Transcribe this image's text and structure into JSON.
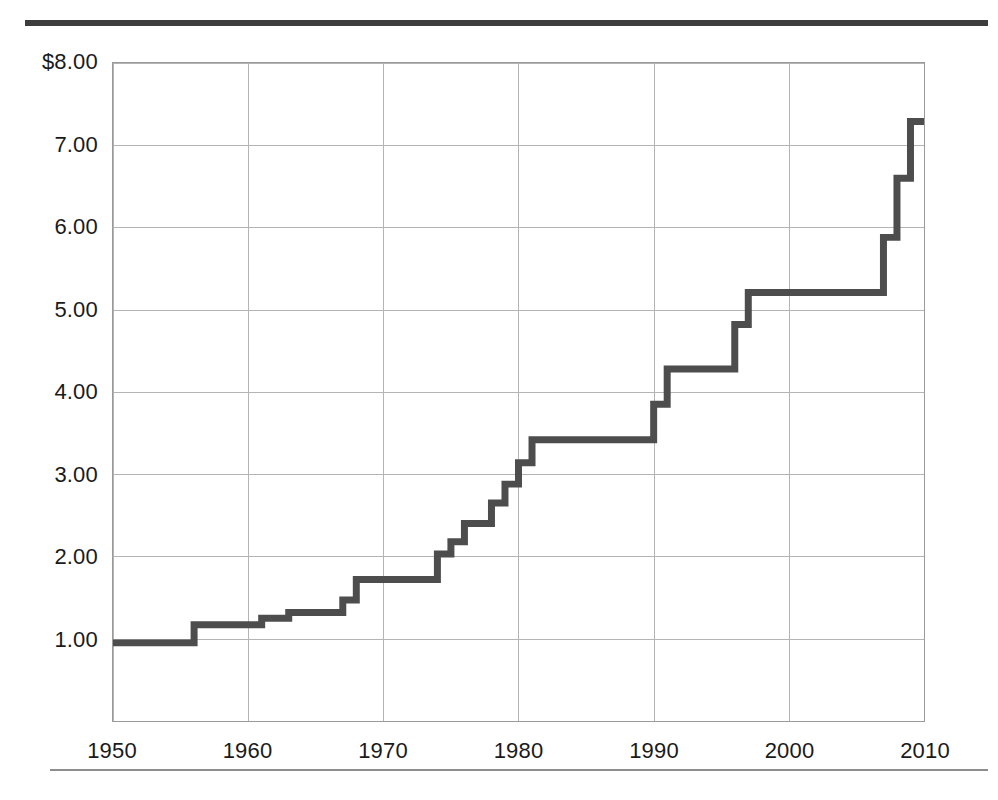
{
  "figure": {
    "top_rule_color": "#3d3d3d",
    "bottom_rule_color": "#8e8e8e"
  },
  "chart_data": {
    "type": "line",
    "line_style": "step-post",
    "title": "",
    "subtitle": "",
    "xlabel": "",
    "ylabel": "",
    "xlim": [
      1950,
      2010
    ],
    "ylim": [
      0,
      8
    ],
    "grid": true,
    "legend": null,
    "line_color": "#4d4d4d",
    "grid_color": "#b4b4b4",
    "axis_color": "#9a9a9a",
    "y_ticks": [
      1,
      2,
      3,
      4,
      5,
      6,
      7,
      8
    ],
    "y_tick_labels": [
      "1.00",
      "2.00",
      "3.00",
      "4.00",
      "5.00",
      "6.00",
      "7.00",
      "$8.00"
    ],
    "x_ticks": [
      1950,
      1960,
      1970,
      1980,
      1990,
      2000,
      2010
    ],
    "x_tick_labels": [
      "1950",
      "1960",
      "1970",
      "1980",
      "1990",
      "2000",
      "2010"
    ],
    "x": [
      1950,
      1956,
      1961,
      1963,
      1967,
      1968,
      1974,
      1975,
      1976,
      1978,
      1979,
      1980,
      1981,
      1990,
      1991,
      1996,
      1997,
      2007,
      2008,
      2009,
      2010
    ],
    "values": [
      0.95,
      1.17,
      1.25,
      1.32,
      1.47,
      1.72,
      2.03,
      2.18,
      2.4,
      2.65,
      2.88,
      3.14,
      3.42,
      3.85,
      4.28,
      4.82,
      5.21,
      5.88,
      6.6,
      7.29,
      7.29
    ],
    "series": [
      {
        "name": "Minimum wage",
        "values": [
          0.95,
          1.17,
          1.25,
          1.32,
          1.47,
          1.72,
          2.03,
          2.18,
          2.4,
          2.65,
          2.88,
          3.14,
          3.42,
          3.85,
          4.28,
          4.82,
          5.21,
          5.88,
          6.6,
          7.29,
          7.29
        ]
      }
    ]
  }
}
